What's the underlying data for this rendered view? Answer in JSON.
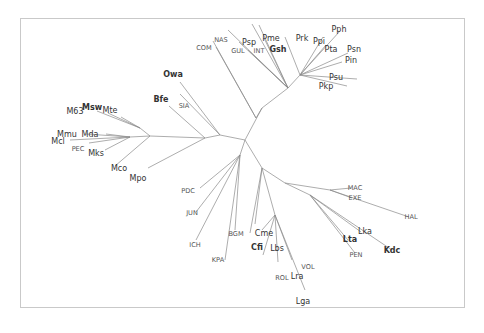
{
  "diagram": {
    "type": "unrooted-phylogenetic-tree",
    "frame": {
      "x": 20,
      "y": 18,
      "w": 445,
      "h": 290,
      "border_color": "#c9c9c9"
    },
    "line_color": "#8a8a8a",
    "text_color": "#555555",
    "root": {
      "x": 245,
      "y": 140
    },
    "internal_nodes": {
      "root": [
        245,
        140
      ],
      "nP": [
        262,
        108
      ],
      "nP2": [
        256,
        118
      ],
      "nP3": [
        288,
        88
      ],
      "nPk": [
        300,
        75
      ],
      "nO": [
        220,
        135
      ],
      "nL": [
        205,
        138
      ],
      "nM": [
        150,
        136
      ],
      "nMa": [
        130,
        137
      ],
      "nMb": [
        140,
        128
      ],
      "nD": [
        240,
        155
      ],
      "nC": [
        262,
        168
      ],
      "nK": [
        285,
        183
      ],
      "nK2": [
        330,
        190
      ],
      "nK3": [
        310,
        195
      ],
      "nLc": [
        275,
        215
      ]
    },
    "edges": [
      [
        "root",
        "nP"
      ],
      [
        "nP",
        "nP2"
      ],
      [
        "nP2",
        [
          216,
          47
        ]
      ],
      [
        "nP2",
        [
          213,
          41
        ]
      ],
      [
        "nP",
        "nP3"
      ],
      [
        "nP3",
        [
          252,
          24
        ]
      ],
      [
        "nP3",
        [
          228,
          30
        ]
      ],
      [
        "nP3",
        [
          239,
          42
        ]
      ],
      [
        "nP3",
        [
          248,
          50
        ]
      ],
      [
        "nP3",
        [
          259,
          25
        ]
      ],
      [
        "nP3",
        [
          264,
          38
        ]
      ],
      [
        "nP3",
        "nPk"
      ],
      [
        "nPk",
        [
          285,
          37
        ]
      ],
      [
        "nPk",
        [
          323,
          37
        ]
      ],
      [
        "nPk",
        [
          340,
          31
        ]
      ],
      [
        "nPk",
        [
          326,
          45
        ]
      ],
      [
        "nPk",
        [
          348,
          53
        ]
      ],
      [
        "nPk",
        [
          342,
          62
        ]
      ],
      [
        "nPk",
        [
          357,
          79
        ]
      ],
      [
        "nPk",
        [
          347,
          86
        ]
      ],
      [
        "root",
        "nO"
      ],
      [
        "nO",
        [
          180,
          82
        ]
      ],
      [
        "nO",
        [
          180,
          94
        ]
      ],
      [
        "nO",
        "nL"
      ],
      [
        "nL",
        [
          169,
          106
        ]
      ],
      [
        "nL",
        "nM"
      ],
      [
        "nM",
        "nMb"
      ],
      [
        "nMb",
        [
          97,
          111
        ]
      ],
      [
        "nMb",
        [
          108,
          113
        ]
      ],
      [
        "nMb",
        [
          121,
          117
        ]
      ],
      [
        "nM",
        "nMa"
      ],
      [
        "nMa",
        [
          70,
          140
        ]
      ],
      [
        "nMa",
        [
          86,
          134
        ]
      ],
      [
        "nMa",
        [
          106,
          134
        ]
      ],
      [
        "nMa",
        [
          89,
          143
        ]
      ],
      [
        "nMa",
        [
          105,
          150
        ]
      ],
      [
        "nM",
        [
          115,
          166
        ]
      ],
      [
        "nL",
        [
          148,
          168
        ]
      ],
      [
        "root",
        "nD"
      ],
      [
        "nD",
        [
          200,
          188
        ]
      ],
      [
        "nD",
        [
          196,
          212
        ]
      ],
      [
        "nD",
        [
          196,
          240
        ]
      ],
      [
        "nD",
        [
          225,
          260
        ]
      ],
      [
        "nD",
        [
          235,
          230
        ]
      ],
      [
        "root",
        "nC"
      ],
      [
        "nC",
        [
          255,
          224
        ]
      ],
      [
        "nC",
        [
          250,
          233
        ]
      ],
      [
        "nC",
        "nLc"
      ],
      [
        "nLc",
        [
          262,
          230
        ]
      ],
      [
        "nLc",
        [
          263,
          255
        ]
      ],
      [
        "nLc",
        [
          278,
          262
        ]
      ],
      [
        "nLc",
        [
          292,
          260
        ]
      ],
      [
        "nLc",
        [
          305,
          290
        ]
      ],
      [
        "nC",
        "nK"
      ],
      [
        "nK",
        "nK2"
      ],
      [
        "nK2",
        [
          351,
          188
        ]
      ],
      [
        "nK2",
        [
          352,
          198
        ]
      ],
      [
        "nK2",
        [
          409,
          217
        ]
      ],
      [
        "nK",
        "nK3"
      ],
      [
        "nK3",
        [
          361,
          232
        ]
      ],
      [
        "nK3",
        [
          392,
          250
        ]
      ],
      [
        "nK3",
        [
          348,
          240
        ]
      ],
      [
        "nK3",
        [
          355,
          253
        ]
      ]
    ],
    "taxa": [
      {
        "label": "NAS",
        "x": 221,
        "y": 42,
        "style": "small"
      },
      {
        "label": "COM",
        "x": 204,
        "y": 50,
        "style": "small"
      },
      {
        "label": "Psp",
        "x": 249,
        "y": 45,
        "style": "big"
      },
      {
        "label": "GUL",
        "x": 238,
        "y": 53,
        "style": "small"
      },
      {
        "label": "INT",
        "x": 259,
        "y": 53,
        "style": "small"
      },
      {
        "label": "Pme",
        "x": 271,
        "y": 41,
        "style": "big"
      },
      {
        "label": "Gsh",
        "x": 278,
        "y": 52,
        "style": "bold"
      },
      {
        "label": "Prk",
        "x": 302,
        "y": 41,
        "style": "big"
      },
      {
        "label": "Ppi",
        "x": 319,
        "y": 44,
        "style": "big"
      },
      {
        "label": "Pph",
        "x": 339,
        "y": 32,
        "style": "big"
      },
      {
        "label": "Pta",
        "x": 331,
        "y": 52,
        "style": "big"
      },
      {
        "label": "Psn",
        "x": 354,
        "y": 52,
        "style": "big"
      },
      {
        "label": "Pin",
        "x": 351,
        "y": 63,
        "style": "big"
      },
      {
        "label": "Psu",
        "x": 336,
        "y": 80,
        "style": "big"
      },
      {
        "label": "Pkp",
        "x": 326,
        "y": 89,
        "style": "big"
      },
      {
        "label": "Owa",
        "x": 173,
        "y": 77,
        "style": "bold"
      },
      {
        "label": "Bfe",
        "x": 161,
        "y": 102,
        "style": "bold"
      },
      {
        "label": "SIA",
        "x": 184,
        "y": 108,
        "style": "small"
      },
      {
        "label": "M63",
        "x": 75,
        "y": 114,
        "style": "big"
      },
      {
        "label": "Msw",
        "x": 92,
        "y": 110,
        "style": "bold"
      },
      {
        "label": "Mte",
        "x": 110,
        "y": 113,
        "style": "big"
      },
      {
        "label": "Mmu",
        "x": 67,
        "y": 137,
        "style": "big"
      },
      {
        "label": "Mda",
        "x": 90,
        "y": 137,
        "style": "big"
      },
      {
        "label": "Mcl",
        "x": 58,
        "y": 144,
        "style": "big"
      },
      {
        "label": "PEC",
        "x": 78,
        "y": 151,
        "style": "small"
      },
      {
        "label": "Mks",
        "x": 96,
        "y": 156,
        "style": "big"
      },
      {
        "label": "Mco",
        "x": 119,
        "y": 171,
        "style": "big"
      },
      {
        "label": "Mpo",
        "x": 138,
        "y": 181,
        "style": "big"
      },
      {
        "label": "PDC",
        "x": 188,
        "y": 193,
        "style": "small"
      },
      {
        "label": "JUN",
        "x": 192,
        "y": 215,
        "style": "small"
      },
      {
        "label": "ICH",
        "x": 195,
        "y": 247,
        "style": "small"
      },
      {
        "label": "KPA",
        "x": 218,
        "y": 262,
        "style": "small"
      },
      {
        "label": "BGM",
        "x": 236,
        "y": 236,
        "style": "small"
      },
      {
        "label": "Cme",
        "x": 264,
        "y": 236,
        "style": "big"
      },
      {
        "label": "Cfi",
        "x": 257,
        "y": 250,
        "style": "bold"
      },
      {
        "label": "Lbs",
        "x": 277,
        "y": 251,
        "style": "big"
      },
      {
        "label": "VOL",
        "x": 308,
        "y": 269,
        "style": "small"
      },
      {
        "label": "ROL",
        "x": 282,
        "y": 280,
        "style": "small"
      },
      {
        "label": "Lra",
        "x": 297,
        "y": 279,
        "style": "big"
      },
      {
        "label": "Lga",
        "x": 303,
        "y": 304,
        "style": "big"
      },
      {
        "label": "MAC",
        "x": 355,
        "y": 190,
        "style": "small"
      },
      {
        "label": "EXE",
        "x": 355,
        "y": 200,
        "style": "small"
      },
      {
        "label": "HAL",
        "x": 411,
        "y": 219,
        "style": "small"
      },
      {
        "label": "Lka",
        "x": 365,
        "y": 234,
        "style": "big"
      },
      {
        "label": "Lta",
        "x": 350,
        "y": 242,
        "style": "bold"
      },
      {
        "label": "Kdc",
        "x": 392,
        "y": 253,
        "style": "bold"
      },
      {
        "label": "PEN",
        "x": 356,
        "y": 257,
        "style": "small"
      }
    ]
  }
}
